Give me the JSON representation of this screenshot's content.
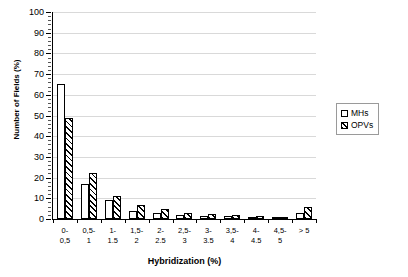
{
  "chart_data": {
    "type": "bar",
    "title": "",
    "xlabel": "Hybridization (%)",
    "ylabel": "Number of Fields (%)",
    "ylim": [
      0,
      100
    ],
    "ytick_step": 10,
    "grid": true,
    "legend_position": "right",
    "categories": [
      "0-\n0,5",
      "0,5-\n1",
      "1-\n1.5",
      "1,5-\n2",
      "2-\n2.5",
      "2,5-\n3",
      "3-\n3.5",
      "3,5-\n4",
      "4-\n4.5",
      "4,5-\n5",
      "> 5"
    ],
    "ytick_labels": [
      "100",
      "90",
      "80",
      "70",
      "60",
      "50",
      "40",
      "30",
      "20",
      "10",
      "0"
    ],
    "series": [
      {
        "name": "MHs",
        "values": [
          65,
          17,
          9,
          4,
          3,
          2,
          1.5,
          1.5,
          1,
          0.5,
          3
        ]
      },
      {
        "name": "OPVs",
        "values": [
          49,
          22,
          11,
          7,
          5,
          3,
          2.5,
          2,
          1.5,
          1,
          6
        ]
      }
    ]
  },
  "legend": {
    "entries": [
      {
        "label": "MHs"
      },
      {
        "label": "OPVs"
      }
    ]
  },
  "colors": {
    "bar_mhs": "#ffffff",
    "bar_opvs_hatch": "#000000",
    "axis": "#000000",
    "gridline": "#d9d9d9"
  }
}
